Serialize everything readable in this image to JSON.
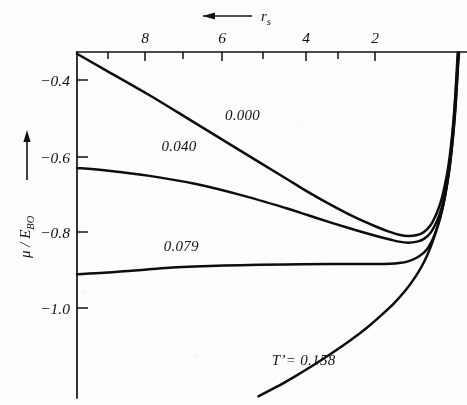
{
  "figure": {
    "title": "",
    "background_color": "#fdfdfb",
    "ink_color": "#111111"
  },
  "chart_data": {
    "type": "line",
    "title": "",
    "xlabel": "r_s",
    "ylabel": "mu / E_BO",
    "xlabel_display": "r",
    "xlabel_sub": "s",
    "ylabel_display": "μ / E",
    "ylabel_sub": "BO",
    "x_axis_position": "top",
    "x_direction": "decreasing-left-to-right",
    "xlim": [
      9.6,
      1.0
    ],
    "ylim": [
      -1.22,
      -0.22
    ],
    "grid": false,
    "legend": "inline-curve-labels",
    "xticks_major": [
      8,
      6,
      4,
      2
    ],
    "xticklabels": [
      "8",
      "6",
      "4",
      "2"
    ],
    "xticks_minor": [
      9,
      7,
      5,
      3
    ],
    "yticks": [
      -0.4,
      -0.6,
      -0.8,
      -1.0
    ],
    "yticklabels": [
      "−0.4",
      "−0.6",
      "−0.8",
      "−1.0"
    ],
    "series": [
      {
        "name": "0.000",
        "label": "0.000",
        "label_x": 5.95,
        "label_y": -0.415,
        "points": [
          [
            9.6,
            -0.225
          ],
          [
            9.0,
            -0.27
          ],
          [
            8.0,
            -0.345
          ],
          [
            7.0,
            -0.425
          ],
          [
            6.0,
            -0.505
          ],
          [
            5.0,
            -0.585
          ],
          [
            4.5,
            -0.625
          ],
          [
            4.0,
            -0.662
          ],
          [
            3.5,
            -0.696
          ],
          [
            3.0,
            -0.725
          ],
          [
            2.7,
            -0.74
          ],
          [
            2.5,
            -0.748
          ],
          [
            2.3,
            -0.752
          ],
          [
            2.1,
            -0.749
          ],
          [
            1.95,
            -0.74
          ],
          [
            1.8,
            -0.72
          ],
          [
            1.65,
            -0.68
          ],
          [
            1.55,
            -0.64
          ],
          [
            1.45,
            -0.58
          ],
          [
            1.38,
            -0.52
          ],
          [
            1.32,
            -0.45
          ],
          [
            1.27,
            -0.375
          ],
          [
            1.23,
            -0.3
          ],
          [
            1.2,
            -0.24
          ],
          [
            1.185,
            -0.222
          ]
        ]
      },
      {
        "name": "0.040",
        "label": "0.040",
        "label_x": 7.35,
        "label_y": -0.505,
        "points": [
          [
            9.6,
            -0.555
          ],
          [
            9.0,
            -0.562
          ],
          [
            8.0,
            -0.578
          ],
          [
            7.0,
            -0.601
          ],
          [
            6.0,
            -0.633
          ],
          [
            5.0,
            -0.671
          ],
          [
            4.5,
            -0.692
          ],
          [
            4.0,
            -0.713
          ],
          [
            3.5,
            -0.733
          ],
          [
            3.0,
            -0.752
          ],
          [
            2.7,
            -0.762
          ],
          [
            2.5,
            -0.768
          ],
          [
            2.3,
            -0.771
          ],
          [
            2.1,
            -0.768
          ],
          [
            1.95,
            -0.76
          ],
          [
            1.8,
            -0.742
          ],
          [
            1.65,
            -0.705
          ],
          [
            1.55,
            -0.666
          ],
          [
            1.45,
            -0.608
          ],
          [
            1.38,
            -0.548
          ],
          [
            1.32,
            -0.478
          ],
          [
            1.27,
            -0.4
          ],
          [
            1.23,
            -0.322
          ],
          [
            1.2,
            -0.258
          ],
          [
            1.175,
            -0.222
          ]
        ]
      },
      {
        "name": "0.079",
        "label": "0.079",
        "label_x": 7.3,
        "label_y": -0.795,
        "points": [
          [
            9.6,
            -0.862
          ],
          [
            9.0,
            -0.858
          ],
          [
            8.4,
            -0.852
          ],
          [
            8.0,
            -0.848
          ],
          [
            7.5,
            -0.843
          ],
          [
            7.0,
            -0.84
          ],
          [
            6.0,
            -0.836
          ],
          [
            5.0,
            -0.834
          ],
          [
            4.0,
            -0.833
          ],
          [
            3.5,
            -0.833
          ],
          [
            3.0,
            -0.833
          ],
          [
            2.7,
            -0.832
          ],
          [
            2.5,
            -0.83
          ],
          [
            2.3,
            -0.825
          ],
          [
            2.1,
            -0.814
          ],
          [
            1.95,
            -0.8
          ],
          [
            1.85,
            -0.784
          ],
          [
            1.75,
            -0.76
          ],
          [
            1.65,
            -0.725
          ],
          [
            1.55,
            -0.678
          ],
          [
            1.47,
            -0.625
          ],
          [
            1.4,
            -0.56
          ],
          [
            1.34,
            -0.488
          ],
          [
            1.29,
            -0.412
          ],
          [
            1.25,
            -0.33
          ],
          [
            1.22,
            -0.26
          ],
          [
            1.205,
            -0.222
          ]
        ]
      },
      {
        "name": "T' = 0.158",
        "label": "T’= 0.158",
        "label_x": 4.6,
        "label_y": -1.125,
        "points": [
          [
            5.6,
            -1.215
          ],
          [
            5.2,
            -1.188
          ],
          [
            4.8,
            -1.158
          ],
          [
            4.4,
            -1.126
          ],
          [
            4.0,
            -1.092
          ],
          [
            3.6,
            -1.056
          ],
          [
            3.2,
            -1.016
          ],
          [
            2.9,
            -0.982
          ],
          [
            2.6,
            -0.945
          ],
          [
            2.35,
            -0.908
          ],
          [
            2.15,
            -0.872
          ],
          [
            2.0,
            -0.84
          ],
          [
            1.88,
            -0.808
          ],
          [
            1.78,
            -0.776
          ],
          [
            1.68,
            -0.738
          ],
          [
            1.6,
            -0.702
          ],
          [
            1.52,
            -0.66
          ],
          [
            1.45,
            -0.612
          ],
          [
            1.39,
            -0.56
          ],
          [
            1.34,
            -0.505
          ],
          [
            1.29,
            -0.44
          ],
          [
            1.25,
            -0.375
          ],
          [
            1.22,
            -0.31
          ],
          [
            1.195,
            -0.25
          ],
          [
            1.185,
            -0.222
          ]
        ]
      }
    ],
    "annotations": [
      {
        "name": "x-axis-arrow",
        "text": "←",
        "meaning": "direction of increasing r_s is to the left"
      },
      {
        "name": "y-axis-arrow",
        "text": "↑",
        "meaning": "direction of increasing mu/E_BO is upward"
      }
    ]
  }
}
